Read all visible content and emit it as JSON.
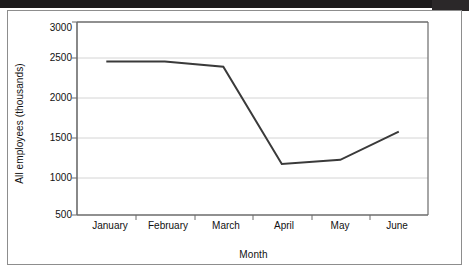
{
  "figure": {
    "background_color": "#ffffff",
    "frame_color": "#8d8d8d",
    "scan_bar_color": "#1d1b1c"
  },
  "chart_data": {
    "type": "line",
    "title": "",
    "xlabel": "Month",
    "ylabel": "All employees (thousands)",
    "categories": [
      "January",
      "February",
      "March",
      "April",
      "May",
      "June"
    ],
    "values": [
      2490,
      2490,
      2420,
      1160,
      1215,
      1580
    ],
    "series": [
      {
        "name": "All employees",
        "values": [
          2490,
          2490,
          2420,
          1160,
          1215,
          1580
        ],
        "color": "#3a3a3a"
      }
    ],
    "ylim": [
      500,
      3000
    ],
    "y_ticks": [
      3000,
      2500,
      2000,
      1500,
      1000,
      500
    ],
    "y_tick_labels": [
      "3000",
      "2500",
      "2000",
      "1500",
      "1000",
      "500"
    ],
    "x_tick_labels": [
      "January",
      "February",
      "March",
      "April",
      "May",
      "June"
    ],
    "grid": true,
    "grid_axis": "y",
    "grid_color": "#d4d4d4",
    "legend": "none",
    "line_color": "#3a3a3a",
    "line_width": 2,
    "markers": "none",
    "axis_color": "#6b6b6b"
  }
}
